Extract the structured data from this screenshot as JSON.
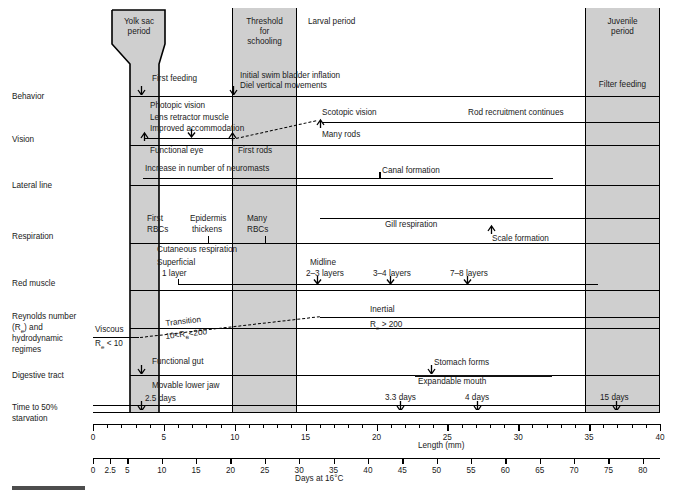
{
  "rows": [
    {
      "id": "behavior",
      "label": "Behavior"
    },
    {
      "id": "vision",
      "label": "Vision"
    },
    {
      "id": "lateral-line",
      "label": "Lateral line"
    },
    {
      "id": "respiration",
      "label": "Respiration"
    },
    {
      "id": "red-muscle",
      "label": "Red muscle"
    },
    {
      "id": "reynolds",
      "label": "Reynolds number\n(Re) and\nhydrodynamic\nregimes"
    },
    {
      "id": "digestive",
      "label": "Digestive tract"
    },
    {
      "id": "starvation",
      "label": "Time to 50%\nstarvation"
    }
  ],
  "row_labels": {
    "behavior": "Behavior",
    "vision": "Vision",
    "lateral_line": "Lateral line",
    "respiration": "Respiration",
    "red_muscle": "Red muscle",
    "reynolds_1": "Reynolds number",
    "reynolds_2": "(Re) and",
    "reynolds_3": "hydrodynamic",
    "reynolds_4": "regimes",
    "digestive": "Digestive tract",
    "starvation_1": "Time to 50%",
    "starvation_2": "starvation"
  },
  "periods": {
    "yolk_sac": "Yolk sac\nperiod",
    "yolk_sac_l1": "Yolk sac",
    "yolk_sac_l2": "period",
    "schooling_l1": "Threshold",
    "schooling_l2": "for",
    "schooling_l3": "schooling",
    "larval": "Larval period",
    "juvenile_l1": "Juvenile",
    "juvenile_l2": "period",
    "juvenile_event": "Filter feeding"
  },
  "events": {
    "first_feeding": "First feeding",
    "swim_bladder": "Initial swim bladder inflation",
    "diel_vertical": "Diel vertical movements",
    "photopic_vision": "Photopic vision",
    "lens_retractor": "Lens retractor muscle",
    "improved_accommodation": "Improved accommodation",
    "functional_eye": "Functional eye",
    "first_rods": "First rods",
    "scotopic_vision": "Scotopic vision",
    "many_rods": "Many rods",
    "rod_recruitment": "Rod recruitment continues",
    "neuromasts": "Increase in number of neuromasts",
    "canal_formation": "Canal formation",
    "first_rbcs_1": "First",
    "first_rbcs_2": "RBCs",
    "epidermis_1": "Epidermis",
    "epidermis_2": "thickens",
    "many_rbcs_1": "Many",
    "many_rbcs_2": "RBCs",
    "gill_respiration": "Gill respiration",
    "cutaneous_respiration": "Cutaneous respiration",
    "scale_formation": "Scale formation",
    "superficial_1": "Superficial",
    "superficial_2": "1 layer",
    "midline_1": "Midline",
    "midline_2": "2–3 layers",
    "layers_34": "3–4 layers",
    "layers_78": "7–8 layers",
    "viscous_1": "Viscous",
    "viscous_2": "Re < 10",
    "transition_1": "Transition",
    "transition_2": "10<Re<200",
    "inertial_1": "Inertial",
    "inertial_2": "Re > 200",
    "functional_gut": "Functional gut",
    "stomach_forms": "Stomach forms",
    "movable_jaw": "Movable lower jaw",
    "expandable_mouth": "Expandable mouth",
    "days_25": "2.5 days",
    "days_33": "3.3 days",
    "days_4": "4 days",
    "days_15": "15 days"
  },
  "axes": {
    "length": {
      "title": "Length (mm)",
      "labels": [
        "0",
        "5",
        "10",
        "15",
        "20",
        "25",
        "30",
        "35",
        "40"
      ],
      "values": [
        0,
        5,
        10,
        15,
        20,
        25,
        30,
        35,
        40
      ],
      "min": 0,
      "max": 40,
      "minor_step": 1
    },
    "days": {
      "title": "Days at 16°C",
      "labels": [
        "0",
        "2.5",
        "5",
        "10",
        "15",
        "20",
        "25",
        "30",
        "35",
        "40",
        "45",
        "50",
        "55",
        "60",
        "65",
        "70",
        "75",
        "80"
      ],
      "values": [
        0,
        2.5,
        5,
        10,
        15,
        20,
        25,
        30,
        35,
        40,
        45,
        50,
        55,
        60,
        65,
        70,
        75,
        80
      ],
      "min": 0,
      "max": 82.5
    }
  },
  "colors": {
    "band_fill": "#cfcfcf",
    "line": "#000000",
    "text": "#1a1a1a",
    "scalebar": "#4d4d4d"
  },
  "chart_data": {
    "type": "table",
    "xlabel": "Length (mm)",
    "xlabel2": "Days at 16°C",
    "xlim": [
      0,
      40
    ],
    "grid": false,
    "legend": "none",
    "categories": [
      "Behavior",
      "Vision",
      "Lateral line",
      "Respiration",
      "Red muscle",
      "Reynolds number (Re) and hydrodynamic regimes",
      "Digestive tract",
      "Time to 50% starvation"
    ],
    "shaded_periods": [
      {
        "name": "Yolk sac period",
        "start_mm": 1.5,
        "end_mm": 5.2,
        "shape": "funnel"
      },
      {
        "name": "Threshold for schooling",
        "start_mm": 10,
        "end_mm": 14.5,
        "shape": "rect"
      },
      {
        "name": "Larval period",
        "start_mm": 14.5,
        "end_mm": 35,
        "shape": "none"
      },
      {
        "name": "Juvenile period",
        "start_mm": 35,
        "end_mm": 40,
        "shape": "rect"
      }
    ],
    "markers": [
      {
        "row": "Behavior",
        "label": "First feeding",
        "mm": 4.1
      },
      {
        "row": "Behavior",
        "label": "Initial swim bladder inflation / Diel vertical movements",
        "mm": 10.2
      },
      {
        "row": "Vision",
        "label": "Functional eye",
        "mm": 2.8
      },
      {
        "row": "Vision",
        "label": "First rods",
        "mm": 10.2
      },
      {
        "row": "Vision",
        "label": "Many rods",
        "mm": 20.5
      },
      {
        "row": "Respiration",
        "label": "Epidermis thickens",
        "mm": 7.6
      },
      {
        "row": "Respiration",
        "label": "Many RBCs",
        "mm": 11.8
      },
      {
        "row": "Respiration",
        "label": "Scale formation",
        "mm": 27.9
      },
      {
        "row": "Red muscle",
        "label": "2-3 layers",
        "mm": 20.6
      },
      {
        "row": "Red muscle",
        "label": "3-4 layers",
        "mm": 23.1
      },
      {
        "row": "Red muscle",
        "label": "7-8 layers",
        "mm": 26.5
      },
      {
        "row": "Lateral line",
        "label": "Canal formation",
        "mm": 20.0
      },
      {
        "row": "Digestive tract",
        "label": "Functional gut",
        "mm": 4.1
      },
      {
        "row": "Digestive tract",
        "label": "Stomach forms",
        "mm": 23.5
      },
      {
        "row": "Time to 50% starvation",
        "label": "2.5 days",
        "mm": 4.1
      },
      {
        "row": "Time to 50% starvation",
        "label": "3.3 days",
        "mm": 21.8
      },
      {
        "row": "Time to 50% starvation",
        "label": "4 days",
        "mm": 27.8
      },
      {
        "row": "Time to 50% starvation",
        "label": "15 days",
        "mm": 36.2
      }
    ]
  }
}
